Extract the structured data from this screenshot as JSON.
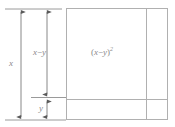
{
  "figure": {
    "kind": "geometric-algebra-diagram",
    "stroke_color": "#a6a6a6",
    "text_color": "#8a8a8a",
    "background_color": "#ffffff"
  },
  "dimensions": {
    "total": {
      "name": "x",
      "label": "x",
      "arrow": "double-headed-vertical",
      "from_y": 9,
      "to_y": 119
    },
    "upper": {
      "name": "x-minus-y",
      "label_lead": "x",
      "label_operator": "−",
      "label_trail": "y",
      "arrow": "double-headed-vertical",
      "from_y": 9,
      "to_y": 97
    },
    "lower": {
      "name": "y",
      "label": "y",
      "arrow": "double-headed-vertical",
      "from_y": 99,
      "to_y": 119
    }
  },
  "square": {
    "area_label": {
      "open_paren": "(",
      "lead": "x",
      "operator": "−",
      "trail": "y",
      "close_paren": ")",
      "exponent": "2",
      "plain": "(x − y)²"
    },
    "left": 66,
    "top": 8,
    "right": 168,
    "bottom": 120,
    "vertical_divider_x": 146,
    "horizontal_divider_y": 99
  },
  "guides": {
    "top_tick": {
      "x1": 5,
      "x2": 62,
      "y": 9
    },
    "middle_tick": {
      "x1": 30,
      "x2": 66,
      "y": 97
    },
    "bottom_tick": {
      "x1": 5,
      "x2": 66,
      "y": 120
    }
  }
}
